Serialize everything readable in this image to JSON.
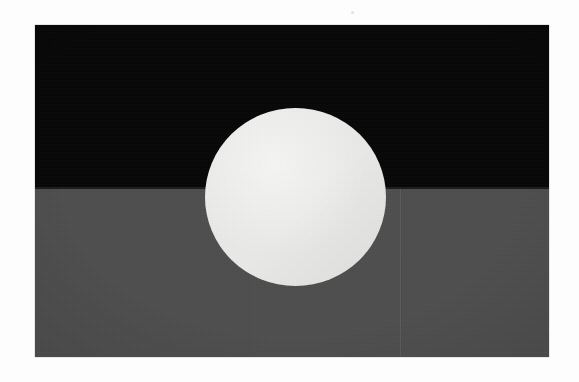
{
  "image": {
    "kind": "photograph-of-flag",
    "width": 579,
    "height": 382,
    "background_color": "#fdfdfd",
    "alt_text": "Photograph of a two-band flag with a large pale disc centred on the dividing line"
  },
  "flag": {
    "name": "two-band-flag-with-central-disc",
    "frame": {
      "x": 35,
      "y": 25,
      "width": 514,
      "height": 332
    },
    "bands": [
      {
        "name": "upper-band",
        "position": "top",
        "color": "#070707",
        "height_px": 164
      },
      {
        "name": "lower-band",
        "position": "bottom",
        "color": "#4e4e4e",
        "height_px": 168
      }
    ],
    "disc": {
      "name": "central-disc",
      "color": "#e9e9e7",
      "center_x": 295,
      "center_y": 195,
      "diameter_px": 181
    },
    "marks": [
      {
        "name": "vertical-crease",
        "x": 400,
        "color": "#585858"
      },
      {
        "name": "band-seam",
        "y": 189,
        "color": "#2b2b2b"
      }
    ]
  },
  "artifacts": {
    "speck": {
      "name": "scan-speck",
      "x": 351,
      "y": 11,
      "color": "#dcdcdc"
    }
  }
}
